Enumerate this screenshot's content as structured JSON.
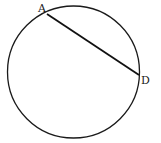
{
  "diagram": {
    "type": "circle-with-chord",
    "circle": {
      "cx": 73.5,
      "cy": 72,
      "r": 66,
      "stroke": "#1a1a1a",
      "stroke_width": 1.3
    },
    "chord": {
      "from": "A",
      "to": "D",
      "x1": 47,
      "y1": 14,
      "x2": 139,
      "y2": 75,
      "stroke": "#111111",
      "stroke_width": 1.8
    },
    "points": [
      {
        "name": "A",
        "label": "A",
        "x": 47,
        "y": 14,
        "label_x": 38,
        "label_y": 12
      },
      {
        "name": "D",
        "label": "D",
        "x": 139,
        "y": 75,
        "label_x": 141,
        "label_y": 84
      }
    ]
  }
}
